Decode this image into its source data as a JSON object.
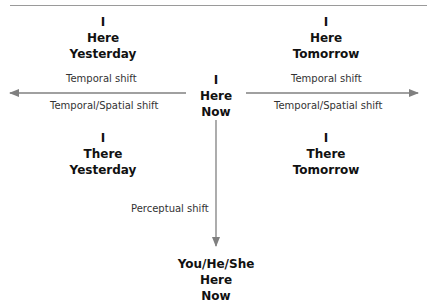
{
  "diagram": {
    "title_partial": "",
    "nodes": {
      "here_yesterday": [
        "I",
        "Here",
        "Yesterday"
      ],
      "here_tomorrow": [
        "I",
        "Here",
        "Tomorrow"
      ],
      "here_now": [
        "I",
        "Here",
        "Now"
      ],
      "there_yesterday": [
        "I",
        "There",
        "Yesterday"
      ],
      "there_tomorrow": [
        "I",
        "There",
        "Tomorrow"
      ],
      "you_here_now": [
        "You/He/She",
        "Here",
        "Now"
      ]
    },
    "edges": {
      "left_temporal": "Temporal shift",
      "left_spatial": "Temporal/Spatial shift",
      "right_temporal": "Temporal shift",
      "right_spatial": "Temporal/Spatial shift",
      "down_perceptual": "Perceptual shift"
    },
    "colors": {
      "arrow": "#808080",
      "text": "#111111",
      "label": "#333333"
    }
  }
}
